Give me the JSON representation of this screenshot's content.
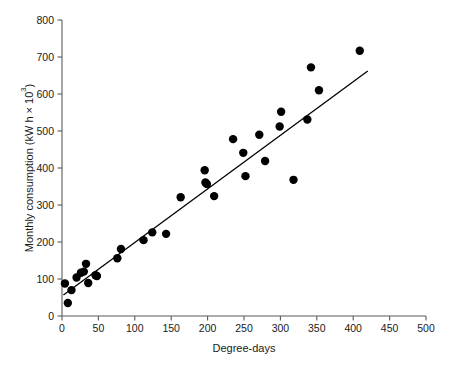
{
  "chart_data": {
    "type": "scatter",
    "title": "",
    "xlabel": "Degree-days",
    "ylabel": "Monthly consumption (kW h × 10³)",
    "ylabel_parts": {
      "main": "Monthly consumption (kW h × 10",
      "exponent": "3",
      "tail": ")"
    },
    "xlim": [
      0,
      500
    ],
    "ylim": [
      0,
      800
    ],
    "xticks": [
      0,
      50,
      100,
      150,
      200,
      250,
      300,
      350,
      400,
      450,
      500
    ],
    "xtick_labels": [
      "0",
      "50",
      "100",
      "150",
      "200",
      "250",
      "300",
      "350",
      "400",
      "450",
      "500"
    ],
    "yticks": [
      0,
      100,
      200,
      300,
      400,
      500,
      600,
      700,
      800
    ],
    "ytick_labels": [
      "0",
      "100",
      "200",
      "300",
      "400",
      "500",
      "600",
      "700",
      "800"
    ],
    "grid": false,
    "legend": false,
    "marker": {
      "shape": "circle",
      "color": "#000000",
      "size_px": 4.6
    },
    "series": [
      {
        "name": "Monthly consumption vs degree-days",
        "points": [
          [
            4,
            88
          ],
          [
            8,
            35
          ],
          [
            13,
            70
          ],
          [
            20,
            104
          ],
          [
            26,
            117
          ],
          [
            30,
            120
          ],
          [
            33,
            141
          ],
          [
            36,
            89
          ],
          [
            46,
            110
          ],
          [
            48,
            108
          ],
          [
            76,
            156
          ],
          [
            81,
            181
          ],
          [
            112,
            205
          ],
          [
            124,
            226
          ],
          [
            143,
            222
          ],
          [
            163,
            321
          ],
          [
            196,
            394
          ],
          [
            197,
            361
          ],
          [
            199,
            357
          ],
          [
            209,
            324
          ],
          [
            235,
            478
          ],
          [
            249,
            441
          ],
          [
            252,
            378
          ],
          [
            271,
            490
          ],
          [
            279,
            419
          ],
          [
            299,
            512
          ],
          [
            301,
            552
          ],
          [
            318,
            368
          ],
          [
            337,
            531
          ],
          [
            342,
            672
          ],
          [
            353,
            610
          ],
          [
            409,
            717
          ]
        ]
      }
    ],
    "fit_line": {
      "type": "linear-regression",
      "x_start": 2,
      "y_start": 57,
      "x_end": 420,
      "y_end": 662,
      "color": "#000000"
    }
  }
}
